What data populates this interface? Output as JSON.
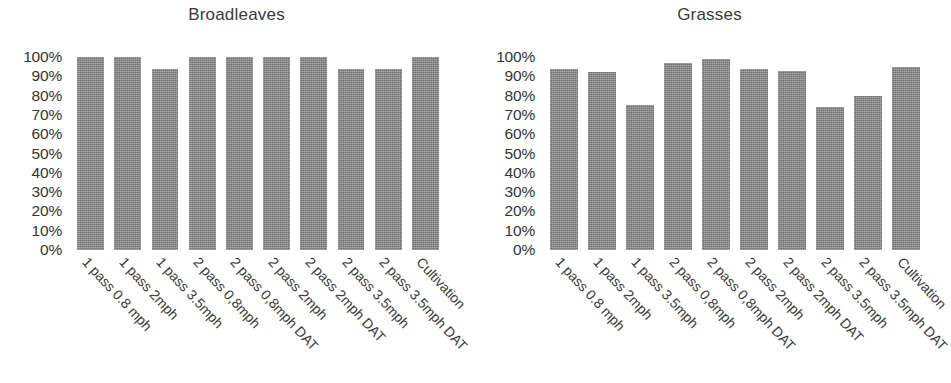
{
  "chart_data": [
    {
      "type": "bar",
      "title": "Broadleaves",
      "xlabel": "",
      "ylabel": "",
      "ylim": [
        0,
        100
      ],
      "grid": false,
      "legend": "none",
      "ytick_labels": [
        "100%",
        "90%",
        "80%",
        "70%",
        "60%",
        "50%",
        "40%",
        "30%",
        "20%",
        "10%",
        "0%"
      ],
      "ytick_values": [
        100,
        90,
        80,
        70,
        60,
        50,
        40,
        30,
        20,
        10,
        0
      ],
      "categories": [
        "1 pass 0.8 mph",
        "1 pass 2mph",
        "1 pass 3.5mph",
        "2 pass 0,8mph",
        "2 pass 0,8mph DAT",
        "2 pass 2mph",
        "2 pass 2mph DAT",
        "2 pass 3.5mph",
        "2 pass 3.5mph DAT",
        "Cultivation"
      ],
      "values": [
        100,
        100,
        94,
        100,
        100,
        100,
        100,
        94,
        94,
        100
      ],
      "bar_color": "#8c8c8c"
    },
    {
      "type": "bar",
      "title": "Grasses",
      "xlabel": "",
      "ylabel": "",
      "ylim": [
        0,
        100
      ],
      "grid": false,
      "legend": "none",
      "ytick_labels": [
        "100%",
        "90%",
        "80%",
        "70%",
        "60%",
        "50%",
        "40%",
        "30%",
        "20%",
        "10%",
        "0%"
      ],
      "ytick_values": [
        100,
        90,
        80,
        70,
        60,
        50,
        40,
        30,
        20,
        10,
        0
      ],
      "categories": [
        "1 pass 0.8 mph",
        "1 pass 2mph",
        "1 pass 3.5mph",
        "2 pass 0,8mph",
        "2 pass 0,8mph DAT",
        "2 pass 2mph",
        "2 pass 2mph DAT",
        "2 pass 3.5mph",
        "2 pass 3.5mph DAT",
        "Cultivation"
      ],
      "values": [
        94,
        92,
        75,
        97,
        99,
        94,
        93,
        74,
        80,
        95
      ],
      "bar_color": "#8c8c8c"
    }
  ],
  "panels": [
    {
      "title": "Broadleaves"
    },
    {
      "title": "Grasses"
    }
  ]
}
